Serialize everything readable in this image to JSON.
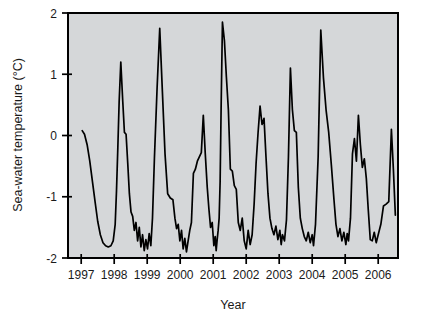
{
  "chart_data": {
    "type": "line",
    "title": "",
    "xlabel": "Year",
    "ylabel": "Sea-water temperature (°C)",
    "xlim": [
      1996.6,
      2006.6
    ],
    "ylim": [
      -2,
      2
    ],
    "xticks": [
      1997,
      1998,
      1999,
      2000,
      2001,
      2002,
      2003,
      2004,
      2005,
      2006
    ],
    "xtick_labels": [
      "1997",
      "1998",
      "1999",
      "2000",
      "2001",
      "2002",
      "2003",
      "2004",
      "2005",
      "2006"
    ],
    "yticks": [
      -2,
      -1,
      0,
      1,
      2
    ],
    "ytick_labels": [
      "-2",
      "-1",
      "0",
      "1",
      "2"
    ],
    "grid": false,
    "legend": false,
    "background_color": "#d5d7d9",
    "line_color": "#000000",
    "series": [
      {
        "name": "Sea-water temperature",
        "x": [
          1997.03,
          1997.1,
          1997.18,
          1997.26,
          1997.34,
          1997.42,
          1997.5,
          1997.58,
          1997.66,
          1997.74,
          1997.82,
          1997.9,
          1997.97,
          1998.03,
          1998.07,
          1998.11,
          1998.15,
          1998.2,
          1998.26,
          1998.31,
          1998.36,
          1998.41,
          1998.46,
          1998.51,
          1998.56,
          1998.61,
          1998.66,
          1998.71,
          1998.76,
          1998.81,
          1998.86,
          1998.91,
          1998.96,
          1999.01,
          1999.06,
          1999.11,
          1999.16,
          1999.22,
          1999.3,
          1999.38,
          1999.46,
          1999.54,
          1999.62,
          1999.7,
          1999.78,
          1999.84,
          1999.89,
          1999.94,
          1999.99,
          2000.04,
          2000.09,
          2000.14,
          2000.19,
          2000.24,
          2000.29,
          2000.34,
          2000.4,
          2000.46,
          2000.52,
          2000.58,
          2000.64,
          2000.7,
          2000.76,
          2000.82,
          2000.87,
          2000.92,
          2000.97,
          2001.02,
          2001.06,
          2001.09,
          2001.12,
          2001.15,
          2001.18,
          2001.21,
          2001.24,
          2001.28,
          2001.34,
          2001.4,
          2001.46,
          2001.52,
          2001.58,
          2001.64,
          2001.7,
          2001.76,
          2001.82,
          2001.88,
          2001.94,
          2002.0,
          2002.06,
          2002.12,
          2002.18,
          2002.24,
          2002.3,
          2002.36,
          2002.42,
          2002.48,
          2002.54,
          2002.6,
          2002.66,
          2002.72,
          2002.78,
          2002.84,
          2002.9,
          2002.96,
          2003.02,
          2003.06,
          2003.1,
          2003.16,
          2003.22,
          2003.28,
          2003.34,
          2003.4,
          2003.46,
          2003.52,
          2003.58,
          2003.64,
          2003.7,
          2003.76,
          2003.82,
          2003.88,
          2003.94,
          2004.0,
          2004.04,
          2004.1,
          2004.18,
          2004.26,
          2004.34,
          2004.42,
          2004.5,
          2004.58,
          2004.66,
          2004.72,
          2004.78,
          2004.84,
          2004.9,
          2004.96,
          2005.02,
          2005.06,
          2005.1,
          2005.16,
          2005.22,
          2005.28,
          2005.34,
          2005.4,
          2005.46,
          2005.52,
          2005.58,
          2005.64,
          2005.7,
          2005.76,
          2005.82,
          2005.88,
          2005.94,
          2006.0,
          2006.08,
          2006.16,
          2006.24,
          2006.32,
          2006.4,
          2006.46,
          2006.52
        ],
        "y": [
          0.08,
          0.02,
          -0.15,
          -0.42,
          -0.75,
          -1.08,
          -1.4,
          -1.62,
          -1.75,
          -1.8,
          -1.82,
          -1.8,
          -1.72,
          -1.45,
          -0.9,
          -0.2,
          0.55,
          1.2,
          0.55,
          0.05,
          0.02,
          -0.45,
          -0.95,
          -1.25,
          -1.32,
          -1.55,
          -1.42,
          -1.72,
          -1.5,
          -1.82,
          -1.62,
          -1.88,
          -1.7,
          -1.85,
          -1.6,
          -1.8,
          -1.35,
          -0.35,
          0.78,
          1.75,
          0.72,
          -0.3,
          -0.95,
          -1.02,
          -1.05,
          -1.35,
          -1.52,
          -1.45,
          -1.72,
          -1.55,
          -1.85,
          -1.68,
          -1.9,
          -1.72,
          -1.55,
          -1.42,
          -0.62,
          -0.55,
          -0.42,
          -0.35,
          -0.28,
          0.33,
          -0.3,
          -0.85,
          -1.2,
          -1.5,
          -1.42,
          -1.8,
          -1.65,
          -1.88,
          -1.7,
          -1.55,
          -1.35,
          -0.75,
          0.45,
          1.85,
          1.55,
          0.95,
          0.42,
          -0.55,
          -0.58,
          -0.82,
          -0.88,
          -1.42,
          -1.55,
          -1.35,
          -1.72,
          -1.85,
          -1.55,
          -1.78,
          -1.62,
          -1.12,
          -0.45,
          0.05,
          0.48,
          0.18,
          0.28,
          -0.35,
          -0.95,
          -1.35,
          -1.52,
          -1.62,
          -1.48,
          -1.7,
          -1.55,
          -1.78,
          -1.62,
          -1.72,
          -1.38,
          -0.35,
          1.1,
          0.42,
          0.08,
          0.05,
          -0.85,
          -1.35,
          -1.52,
          -1.65,
          -1.72,
          -1.58,
          -1.75,
          -1.62,
          -1.8,
          -1.45,
          -0.35,
          1.72,
          0.95,
          0.42,
          0.05,
          -0.48,
          -1.05,
          -1.45,
          -1.65,
          -1.52,
          -1.72,
          -1.58,
          -1.78,
          -1.6,
          -1.72,
          -1.35,
          -0.3,
          -0.05,
          -0.42,
          0.33,
          -0.15,
          -0.52,
          -0.38,
          -0.7,
          -1.22,
          -1.7,
          -1.72,
          -1.58,
          -1.75,
          -1.62,
          -1.45,
          -1.15,
          -1.12,
          -1.08,
          0.1,
          -0.55,
          -1.3
        ]
      }
    ]
  },
  "axes": {
    "ylabel": "Sea-water temperature (°C)",
    "xlabel": "Year"
  }
}
